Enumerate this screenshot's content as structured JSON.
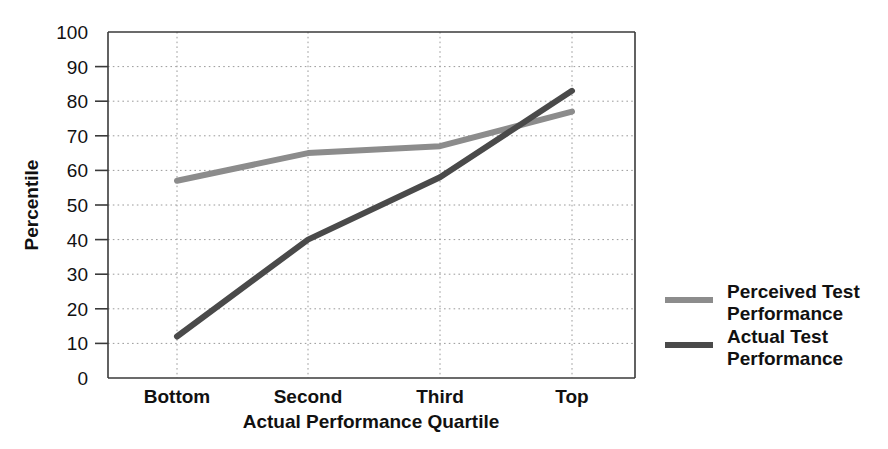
{
  "chart_data": {
    "type": "line",
    "title": "",
    "xlabel": "Actual Performance Quartile",
    "ylabel": "Percentile",
    "categories": [
      "Bottom",
      "Second",
      "Third",
      "Top"
    ],
    "ylim": [
      0,
      100
    ],
    "xlim": [
      0,
      3
    ],
    "ytick_labels": [
      "0",
      "10",
      "20",
      "30",
      "40",
      "50",
      "60",
      "70",
      "80",
      "90",
      "100"
    ],
    "ytick_values": [
      0,
      10,
      20,
      30,
      40,
      50,
      60,
      70,
      80,
      90,
      100
    ],
    "grid": "dotted-both-axes",
    "legend_position": "right",
    "series": [
      {
        "name": "Perceived Test Performance",
        "color": "#8c8c8c",
        "values": [
          57,
          65,
          67,
          77
        ]
      },
      {
        "name": "Actual Test Performance",
        "color": "#4a4a4a",
        "values": [
          12,
          40,
          58,
          83
        ]
      }
    ]
  },
  "axes": {
    "y_title": "Percentile",
    "x_title": "Actual Performance Quartile",
    "y_ticks": [
      {
        "label": "100",
        "value": 100
      },
      {
        "label": "90",
        "value": 90
      },
      {
        "label": "80",
        "value": 80
      },
      {
        "label": "70",
        "value": 70
      },
      {
        "label": "60",
        "value": 60
      },
      {
        "label": "50",
        "value": 50
      },
      {
        "label": "40",
        "value": 40
      },
      {
        "label": "30",
        "value": 30
      },
      {
        "label": "20",
        "value": 20
      },
      {
        "label": "10",
        "value": 10
      },
      {
        "label": "0",
        "value": 0
      }
    ],
    "x_ticks": [
      {
        "label": "Bottom"
      },
      {
        "label": "Second"
      },
      {
        "label": "Third"
      },
      {
        "label": "Top"
      }
    ]
  },
  "legend": {
    "entries": [
      {
        "line1": "Perceived Test",
        "line2": "Performance",
        "color": "#8c8c8c"
      },
      {
        "line1": "Actual Test",
        "line2": "Performance",
        "color": "#4a4a4a"
      }
    ]
  },
  "colors": {
    "perceived": "#8c8c8c",
    "actual": "#4a4a4a",
    "axis": "#3a3a3a",
    "grid": "#9a9a9a",
    "background": "#ffffff"
  }
}
